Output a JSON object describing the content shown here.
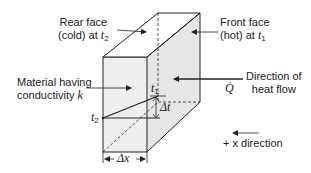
{
  "diagram": {
    "labels": {
      "rear_face_line1": "Rear face",
      "rear_face_line2": "(cold) at",
      "rear_face_var": "t",
      "rear_face_sub": "2",
      "front_face_line1": "Front face",
      "front_face_line2": "(hot) at",
      "front_face_var": "t",
      "front_face_sub": "1",
      "material_line1": "Material having",
      "material_line2": "conductivity",
      "material_var": "k",
      "direction_line1": "Direction of",
      "direction_line2": "heat flow",
      "q_symbol": "Q̇",
      "t1_var": "t",
      "t1_sub": "1",
      "t2_var": "t",
      "t2_sub": "2",
      "delta_t": "Δt",
      "delta_x": "Δx",
      "x_direction": "+ x direction"
    },
    "colors": {
      "line": "#222222",
      "face_fill": "#e8e8e8",
      "front_face_fill": "#f0f0f0",
      "background": "#ffffff"
    }
  }
}
